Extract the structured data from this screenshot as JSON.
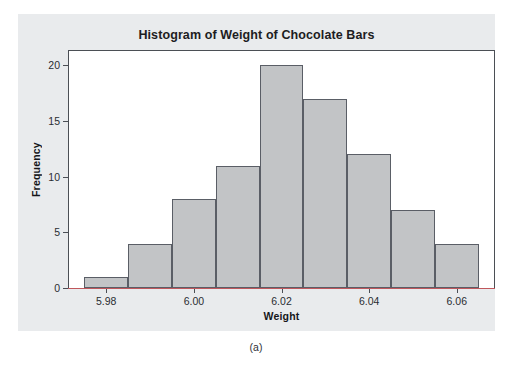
{
  "figure": {
    "caption": "(a)",
    "panel_background": "#e9ebed",
    "plot_background": "#ffffff"
  },
  "chart_data": {
    "type": "bar",
    "title": "Histogram of Weight of Chocolate Bars",
    "xlabel": "Weight",
    "ylabel": "Frequency",
    "bin_width": 0.01,
    "bin_starts": [
      5.975,
      5.985,
      5.995,
      6.005,
      6.015,
      6.025,
      6.035,
      6.045,
      6.055
    ],
    "bin_centers": [
      5.98,
      5.99,
      6.0,
      6.01,
      6.02,
      6.03,
      6.04,
      6.05,
      6.06
    ],
    "categories": [
      "5.975-5.985",
      "5.985-5.995",
      "5.995-6.005",
      "6.005-6.015",
      "6.015-6.025",
      "6.025-6.035",
      "6.035-6.045",
      "6.045-6.055",
      "6.055-6.065"
    ],
    "values": [
      1,
      4,
      8,
      11,
      20,
      17,
      12,
      7,
      4
    ],
    "total_count": 84,
    "xlim": [
      5.9715,
      6.0685
    ],
    "ylim": [
      0,
      21.3
    ],
    "xticks": [
      5.98,
      6.0,
      6.02,
      6.04,
      6.06
    ],
    "xticklabels": [
      "5.98",
      "6.00",
      "6.02",
      "6.04",
      "6.06"
    ],
    "yticks": [
      0,
      5,
      10,
      15,
      20
    ],
    "yticklabels": [
      "0",
      "5",
      "10",
      "15",
      "20"
    ],
    "grid": false,
    "legend": false,
    "bar_fill_color": "#c2c4c6",
    "bar_edge_color": "#5a5e66",
    "axis_color": "#4b4f55",
    "baseline_accent_color": "#c0575c"
  }
}
